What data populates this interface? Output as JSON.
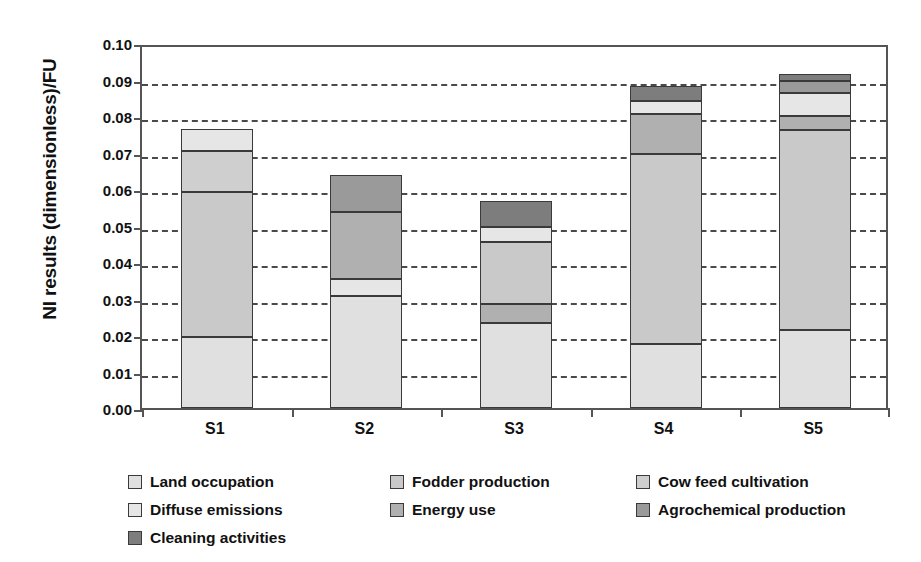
{
  "chart_data": {
    "type": "bar",
    "title": "",
    "subtitle": "",
    "xlabel": "",
    "ylabel": "NI results (dimensionless)/FU",
    "stacked": true,
    "grid": true,
    "legend_position": "bottom",
    "ylim": [
      0,
      0.1
    ],
    "ytick_labels": [
      "0.10",
      "0.09",
      "0.08",
      "0.07",
      "0.06",
      "0.05",
      "0.04",
      "0.03",
      "0.02",
      "0.01",
      "0.00"
    ],
    "ytick_values": [
      0.1,
      0.09,
      0.08,
      0.07,
      0.06,
      0.05,
      0.04,
      0.03,
      0.02,
      0.01,
      0.0
    ],
    "categories": [
      "S1",
      "S2",
      "S3",
      "S4",
      "S5"
    ],
    "series": [
      {
        "name": "Land occupation",
        "color": "#e0e0e0",
        "values": [
          0.0195,
          0.0307,
          0.0233,
          0.0175,
          0.0214
        ]
      },
      {
        "name": "Fodder production",
        "color": "#c9c9c9",
        "values": [
          0.0397,
          0.0,
          0.017,
          0.0521,
          0.0548
        ]
      },
      {
        "name": "Cow feed cultivation",
        "color": "#cfcfcf",
        "values": [
          0.0112,
          0.0,
          0.0,
          0.0,
          0.0
        ]
      },
      {
        "name": "Diffuse emissions",
        "color": "#e6e6e6",
        "values": [
          0.006,
          0.0046,
          0.0041,
          0.0035,
          0.0063
        ]
      },
      {
        "name": "Energy use",
        "color": "#b0b0b0",
        "values": [
          0.0,
          0.0184,
          0.0052,
          0.011,
          0.0038
        ]
      },
      {
        "name": "Agrochemical production",
        "color": "#9a9a9a",
        "values": [
          0.0,
          0.0101,
          0.0,
          0.0,
          0.0033
        ]
      },
      {
        "name": "Cleaning activities",
        "color": "#7d7d7d",
        "values": [
          0.0,
          0.0,
          0.0071,
          0.0041,
          0.0019
        ]
      }
    ],
    "stack_order": {
      "S1": [
        "Land occupation",
        "Fodder production",
        "Cow feed cultivation",
        "Diffuse emissions"
      ],
      "S2": [
        "Land occupation",
        "Diffuse emissions",
        "Energy use",
        "Agrochemical production"
      ],
      "S3": [
        "Land occupation",
        "Energy use",
        "Fodder production",
        "Diffuse emissions",
        "Cleaning activities"
      ],
      "S4": [
        "Land occupation",
        "Fodder production",
        "Energy use",
        "Diffuse emissions",
        "Cleaning activities"
      ],
      "S5": [
        "Land occupation",
        "Fodder production",
        "Energy use",
        "Diffuse emissions",
        "Agrochemical production",
        "Cleaning activities"
      ]
    },
    "totals": [
      0.0764,
      0.0638,
      0.0567,
      0.0882,
      0.0915
    ]
  },
  "legend": {
    "items": [
      {
        "label": "Land occupation",
        "color": "#e0e0e0"
      },
      {
        "label": "Fodder production",
        "color": "#c9c9c9"
      },
      {
        "label": "Cow feed cultivation",
        "color": "#cfcfcf"
      },
      {
        "label": "Diffuse emissions",
        "color": "#e6e6e6"
      },
      {
        "label": "Energy use",
        "color": "#b0b0b0"
      },
      {
        "label": "Agrochemical production",
        "color": "#9a9a9a"
      },
      {
        "label": "Cleaning activities",
        "color": "#7d7d7d"
      }
    ]
  }
}
